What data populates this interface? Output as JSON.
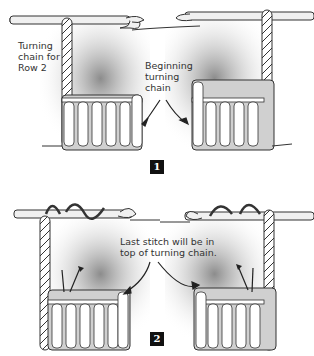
{
  "panels": [
    {
      "step": "1",
      "labels": [
        {
          "text": "Turning chain for Row 2"
        },
        {
          "text": "Beginning turning chain"
        }
      ]
    },
    {
      "step": "2",
      "labels": [
        {
          "text": "Last stitch will be in top of turning chain."
        }
      ]
    }
  ],
  "colors": {
    "shadow": "#9a9a9a",
    "yarn_fill": "#ffffff",
    "yarn_stroke": "#333333",
    "hook_fill": "#f0f0f0",
    "badge": "#111111"
  }
}
